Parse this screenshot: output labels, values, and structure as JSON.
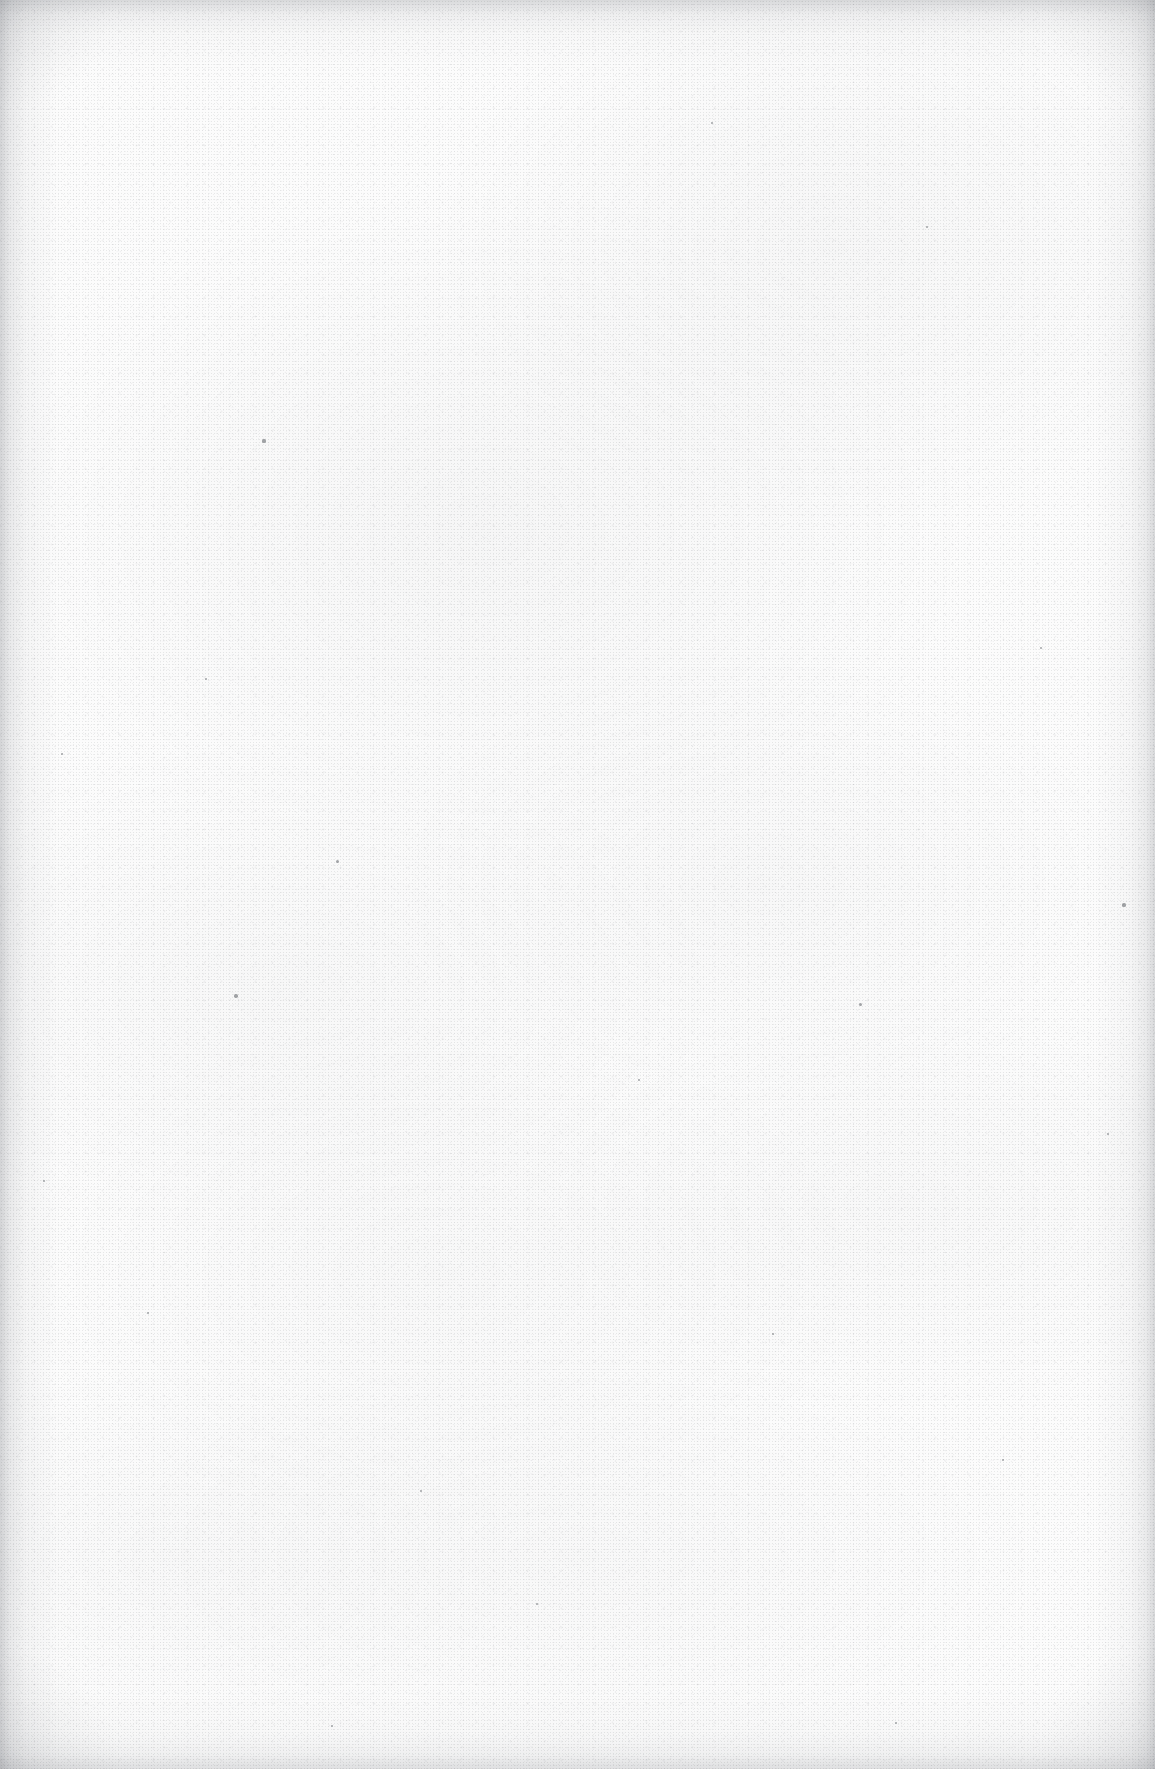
{
  "document": {
    "kind": "scanned-page",
    "content_type": "blank",
    "visible_text": "",
    "page_width_px": 1155,
    "page_height_px": 1769,
    "notes": "Blank scanned sheet: no printed text, headings, figures, tables, page numbers or marginalia are rendered in the pixels."
  },
  "appearance": {
    "paper_color": "#fcfcfc",
    "paper_highlight": "#fdfdfd",
    "grain_color": "#7a7c82",
    "edge_shadow_color": "#787b82",
    "speck_color": "#5a5c62"
  },
  "artifacts": {
    "texture_label": "paper-fibre-speckle",
    "edge_label": "scan-edge-vignette",
    "streak_label": "horizontal-scan-streaks",
    "specks": [
      {
        "x": 264,
        "y": 441,
        "r": 1.6
      },
      {
        "x": 712,
        "y": 123,
        "r": 1.4
      },
      {
        "x": 236,
        "y": 996,
        "r": 1.8
      },
      {
        "x": 337,
        "y": 861,
        "r": 1.5
      },
      {
        "x": 639,
        "y": 1080,
        "r": 1.3
      },
      {
        "x": 860,
        "y": 1004,
        "r": 1.5
      },
      {
        "x": 1108,
        "y": 1134,
        "r": 1.4
      },
      {
        "x": 1124,
        "y": 905,
        "r": 1.6
      },
      {
        "x": 62,
        "y": 754,
        "r": 1.3
      },
      {
        "x": 206,
        "y": 679,
        "r": 1.2
      },
      {
        "x": 537,
        "y": 1604,
        "r": 1.4
      },
      {
        "x": 1003,
        "y": 1460,
        "r": 1.3
      },
      {
        "x": 421,
        "y": 1491,
        "r": 1.2
      },
      {
        "x": 148,
        "y": 1313,
        "r": 1.2
      },
      {
        "x": 927,
        "y": 227,
        "r": 1.3
      },
      {
        "x": 1041,
        "y": 648,
        "r": 1.2
      },
      {
        "x": 773,
        "y": 1334,
        "r": 1.3
      },
      {
        "x": 332,
        "y": 1726,
        "r": 1.2
      },
      {
        "x": 896,
        "y": 1723,
        "r": 1.4
      },
      {
        "x": 44,
        "y": 1181,
        "r": 1.2
      }
    ]
  }
}
